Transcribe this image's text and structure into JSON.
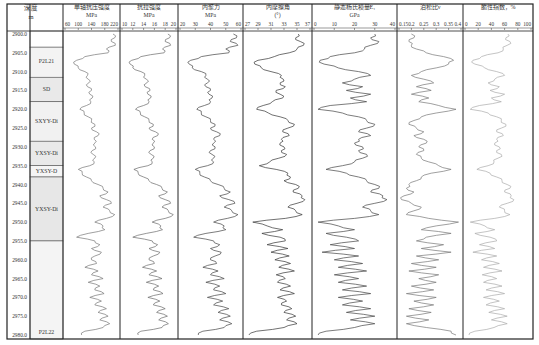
{
  "depth_column": {
    "title": "深度",
    "unit": "m"
  },
  "lithology_column": {
    "units": [
      {
        "label": "",
        "top": 2900.0,
        "bottom": 2903.5,
        "fill": "#ffffff"
      },
      {
        "label": "P2L21",
        "top": 2903.5,
        "bottom": 2911.5,
        "fill": "#f3f3f3"
      },
      {
        "label": "SD",
        "top": 2911.5,
        "bottom": 2918.0,
        "fill": "#e9e9e9"
      },
      {
        "label": "SXYY-Di",
        "top": 2918.0,
        "bottom": 2928.5,
        "fill": "#f1f1f1"
      },
      {
        "label": "YXSY-Di",
        "top": 2928.5,
        "bottom": 2935.0,
        "fill": "#e9e9e9"
      },
      {
        "label": "YXSY-D",
        "top": 2935.0,
        "bottom": 2938.0,
        "fill": "#f5f5f5"
      },
      {
        "label": "YXSY-Di",
        "top": 2938.0,
        "bottom": 2955.0,
        "fill": "#e7e7e7"
      },
      {
        "label": "P2L22",
        "top": 2955.0,
        "bottom": 2980.8,
        "fill": "#f4f4f4"
      }
    ]
  },
  "chart_data": {
    "type": "line",
    "title": "",
    "ylabel": "深度 m",
    "y_axis": {
      "label": "深度",
      "unit": "m",
      "range": [
        2900.0,
        2980.0
      ],
      "ticks": [
        "2900.0",
        "2905.0",
        "2910.0",
        "2915.0",
        "2920.0",
        "2925.0",
        "2930.0",
        "2935.0",
        "2940.0",
        "2945.0",
        "2950.0",
        "2955.0",
        "2960.0",
        "2965.0",
        "2970.0",
        "2975.0",
        "2980.0"
      ],
      "inverted": true
    },
    "grid": false,
    "legend": "none",
    "depth": [
      2900,
      2901,
      2902,
      2903,
      2904,
      2905,
      2906,
      2907,
      2908,
      2909,
      2910,
      2911,
      2912,
      2913,
      2914,
      2915,
      2916,
      2917,
      2918,
      2919,
      2920,
      2921,
      2922,
      2923,
      2924,
      2925,
      2926,
      2927,
      2928,
      2929,
      2930,
      2931,
      2932,
      2933,
      2934,
      2935,
      2936,
      2937,
      2938,
      2939,
      2940,
      2941,
      2942,
      2943,
      2944,
      2945,
      2946,
      2947,
      2948,
      2949,
      2950,
      2951,
      2952,
      2953,
      2954,
      2955,
      2956,
      2957,
      2958,
      2959,
      2960,
      2961,
      2962,
      2963,
      2964,
      2965,
      2966,
      2967,
      2968,
      2969,
      2970,
      2971,
      2972,
      2973,
      2974,
      2975,
      2976,
      2977,
      2978,
      2979,
      2980
    ],
    "tracks": [
      {
        "name": "单轴抗压强度",
        "unit": "MPa",
        "ticks": [
          "60",
          "100",
          "140",
          "180",
          "220"
        ],
        "range": [
          60,
          220
        ],
        "color": "#777777",
        "values": [
          205,
          210,
          200,
          212,
          185,
          190,
          120,
          95,
          88,
          100,
          120,
          128,
          130,
          132,
          128,
          140,
          135,
          142,
          138,
          125,
          105,
          118,
          130,
          140,
          150,
          140,
          155,
          160,
          148,
          150,
          152,
          142,
          145,
          150,
          148,
          135,
          100,
          112,
          125,
          140,
          160,
          175,
          190,
          165,
          185,
          200,
          175,
          195,
          210,
          185,
          150,
          175,
          180,
          130,
          95,
          150,
          165,
          140,
          170,
          150,
          140,
          155,
          120,
          160,
          140,
          175,
          130,
          165,
          150,
          178,
          135,
          170,
          150,
          185,
          160,
          190,
          165,
          195,
          175,
          120,
          110
        ]
      },
      {
        "name": "抗拉强度",
        "unit": "MPa",
        "ticks": [
          "10",
          "12",
          "14",
          "16",
          "18",
          "20"
        ],
        "range": [
          10,
          20
        ],
        "color": "#6a6a6a",
        "values": [
          18.5,
          18.8,
          18.0,
          19.0,
          17.5,
          17.8,
          13.5,
          11.8,
          11.5,
          12.0,
          13.5,
          14.2,
          14.5,
          14.6,
          14.3,
          15.2,
          14.8,
          15.3,
          15.0,
          14.0,
          12.5,
          13.4,
          14.2,
          15.0,
          15.8,
          15.0,
          16.2,
          16.6,
          15.6,
          15.8,
          16.0,
          15.2,
          15.4,
          15.8,
          15.6,
          14.8,
          12.2,
          13.0,
          14.0,
          15.0,
          16.4,
          17.4,
          18.4,
          16.8,
          18.0,
          19.0,
          17.4,
          18.6,
          19.5,
          18.0,
          15.6,
          17.2,
          17.5,
          14.5,
          12.0,
          15.6,
          16.6,
          15.0,
          17.0,
          15.8,
          15.0,
          16.0,
          13.8,
          16.4,
          15.0,
          17.4,
          14.5,
          16.8,
          15.8,
          17.6,
          14.8,
          17.0,
          15.8,
          18.0,
          16.4,
          18.4,
          16.8,
          18.6,
          17.4,
          13.5,
          13.0
        ]
      },
      {
        "name": "内聚力",
        "unit": "MPa",
        "ticks": [
          "20",
          "30",
          "40",
          "50",
          "60"
        ],
        "range": [
          20,
          60
        ],
        "color": "#444444",
        "values": [
          55,
          57,
          53,
          58,
          50,
          52,
          34,
          27,
          26,
          28,
          34,
          37,
          38,
          38,
          37,
          40,
          39,
          41,
          40,
          36,
          31,
          34,
          37,
          40,
          43,
          40,
          44,
          46,
          42,
          42,
          43,
          40,
          41,
          42,
          42,
          38,
          30,
          33,
          36,
          40,
          45,
          49,
          53,
          46,
          52,
          56,
          49,
          54,
          58,
          51,
          42,
          49,
          50,
          37,
          29,
          42,
          46,
          40,
          47,
          43,
          40,
          44,
          35,
          45,
          40,
          49,
          37,
          46,
          42,
          50,
          38,
          48,
          42,
          52,
          45,
          53,
          46,
          54,
          49,
          35,
          32
        ]
      },
      {
        "name": "内摩擦角",
        "unit": "(°)",
        "ticks": [
          "27",
          "29",
          "31",
          "33",
          "35",
          "37"
        ],
        "range": [
          27,
          37
        ],
        "color": "#333333",
        "values": [
          35.2,
          34.8,
          35.5,
          36.0,
          35.0,
          33.8,
          31.5,
          29.0,
          28.5,
          29.5,
          31.0,
          32.6,
          32.9,
          32.4,
          33.2,
          31.8,
          32.4,
          32.8,
          31.2,
          29.8,
          28.8,
          30.6,
          32.4,
          33.6,
          34.6,
          33.6,
          32.8,
          33.8,
          32.6,
          32.4,
          33.0,
          32.6,
          33.4,
          32.2,
          30.8,
          29.2,
          31.8,
          33.6,
          34.0,
          33.0,
          34.8,
          35.2,
          34.4,
          35.8,
          36.2,
          35.0,
          33.6,
          34.8,
          35.8,
          33.2,
          28.2,
          30.4,
          32.8,
          29.6,
          32.4,
          33.2,
          30.4,
          33.6,
          31.0,
          33.8,
          31.6,
          34.0,
          32.2,
          34.6,
          31.8,
          33.2,
          32.0,
          34.0,
          32.4,
          34.6,
          32.0,
          33.4,
          32.6,
          34.2,
          33.0,
          34.8,
          33.4,
          35.0,
          33.0,
          28.8,
          27.6
        ]
      },
      {
        "name": "静态杨氏模量E₁",
        "unit": "GPa",
        "ticks": [
          "0",
          "10",
          "20",
          "30",
          "40"
        ],
        "range": [
          0,
          40
        ],
        "color": "#444444",
        "values": [
          30,
          28,
          32,
          28,
          25,
          20,
          8,
          3,
          5,
          12,
          22,
          28,
          20,
          14,
          24,
          16,
          28,
          18,
          26,
          8,
          2,
          14,
          22,
          26,
          30,
          26,
          22,
          28,
          22,
          20,
          24,
          22,
          26,
          24,
          20,
          14,
          6,
          16,
          22,
          26,
          30,
          32,
          28,
          34,
          36,
          30,
          24,
          28,
          32,
          20,
          2,
          12,
          20,
          6,
          16,
          22,
          8,
          20,
          4,
          22,
          10,
          24,
          12,
          26,
          10,
          22,
          12,
          26,
          14,
          28,
          12,
          24,
          14,
          28,
          16,
          30,
          18,
          30,
          20,
          6,
          2
        ]
      },
      {
        "name": "泊松比ν",
        "unit": "",
        "ticks": [
          "0.15",
          "0.2",
          "0.25",
          "0.3",
          "0.35",
          "0.4"
        ],
        "range": [
          0.15,
          0.4
        ],
        "color": "#777777",
        "values": [
          0.2,
          0.21,
          0.19,
          0.2,
          0.22,
          0.26,
          0.33,
          0.37,
          0.35,
          0.3,
          0.24,
          0.2,
          0.25,
          0.29,
          0.22,
          0.28,
          0.2,
          0.27,
          0.23,
          0.31,
          0.38,
          0.3,
          0.24,
          0.21,
          0.19,
          0.22,
          0.25,
          0.21,
          0.25,
          0.26,
          0.23,
          0.25,
          0.22,
          0.24,
          0.27,
          0.31,
          0.36,
          0.28,
          0.24,
          0.22,
          0.19,
          0.18,
          0.21,
          0.17,
          0.16,
          0.2,
          0.24,
          0.21,
          0.18,
          0.27,
          0.39,
          0.3,
          0.24,
          0.36,
          0.26,
          0.22,
          0.33,
          0.24,
          0.36,
          0.22,
          0.31,
          0.2,
          0.3,
          0.19,
          0.31,
          0.23,
          0.3,
          0.2,
          0.29,
          0.18,
          0.3,
          0.21,
          0.29,
          0.19,
          0.28,
          0.18,
          0.27,
          0.18,
          0.26,
          0.36,
          0.38
        ]
      },
      {
        "name": "脆性指数",
        "unit": "%",
        "ticks": [
          "0",
          "20",
          "40",
          "60",
          "80",
          "100"
        ],
        "range": [
          0,
          100
        ],
        "color": "#aaaaaa",
        "values": [
          65,
          62,
          68,
          64,
          58,
          50,
          25,
          12,
          15,
          30,
          48,
          60,
          45,
          35,
          52,
          38,
          60,
          40,
          55,
          22,
          8,
          35,
          48,
          55,
          62,
          55,
          48,
          58,
          48,
          45,
          52,
          48,
          55,
          50,
          44,
          35,
          18,
          38,
          48,
          56,
          64,
          68,
          60,
          70,
          74,
          64,
          52,
          60,
          68,
          45,
          8,
          30,
          45,
          15,
          38,
          48,
          22,
          45,
          12,
          48,
          25,
          52,
          28,
          56,
          26,
          48,
          28,
          56,
          32,
          60,
          28,
          52,
          32,
          60,
          36,
          64,
          40,
          64,
          44,
          15,
          6
        ]
      }
    ]
  }
}
